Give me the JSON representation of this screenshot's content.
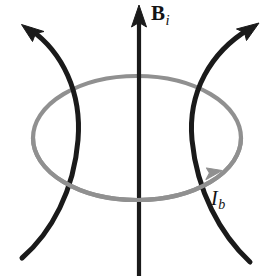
{
  "figure": {
    "kind": "physics-field-diagram",
    "width": 279,
    "height": 276,
    "background_color": "#ffffff"
  },
  "colors": {
    "field_line": "#1a1a1a",
    "axis": "#1a1a1a",
    "loop": "#909090",
    "label_text": "#141414"
  },
  "labels": {
    "field_axis": {
      "symbol": "B",
      "subscript": "i",
      "x": 151,
      "y": 3,
      "style": "bold-serif-italic-subscript"
    },
    "loop_current": {
      "symbol": "I",
      "subscript": "b",
      "x": 211,
      "y": 188,
      "style": "italic-serif-italic-subscript"
    }
  },
  "elements": {
    "vertical_axis": {
      "name": "B-field axis",
      "x": 139,
      "y_top": 8,
      "y_bottom": 276,
      "arrow": "up",
      "stroke_width": 4
    },
    "loop": {
      "name": "current loop",
      "center_x": 137,
      "center_y": 138,
      "rx": 104,
      "ry": 62,
      "stroke_width": 4,
      "arrow_direction": "counterclockwise-viewed-front",
      "arrow_x": 222,
      "arrow_y": 172
    },
    "left_field_line": {
      "name": "left curved field line",
      "arrow_tip_x": 23,
      "arrow_tip_y": 25,
      "waist_x": 78,
      "waist_y": 140,
      "tail_x": 22,
      "tail_y": 258,
      "stroke_width": 5
    },
    "right_field_line": {
      "name": "right curved field line",
      "arrow_tip_x": 258,
      "arrow_tip_y": 23,
      "waist_x": 192,
      "waist_y": 140,
      "tail_x": 250,
      "tail_y": 262,
      "stroke_width": 5
    }
  }
}
